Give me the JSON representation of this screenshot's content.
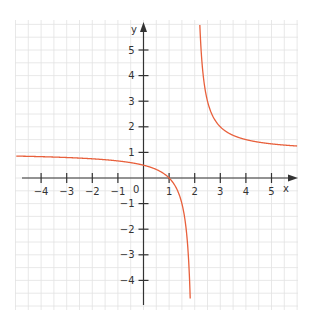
{
  "chart_data": {
    "type": "line",
    "title": "",
    "function": "y = (x - 1) / (x - 2)",
    "xlabel": "x",
    "ylabel": "y",
    "xlim": [
      -5,
      6
    ],
    "ylim": [
      -5,
      5.5
    ],
    "x_ticks": [
      -4,
      -3,
      -2,
      -1,
      1,
      2,
      3,
      4,
      5
    ],
    "y_ticks": [
      5,
      4,
      3,
      2,
      1,
      -1,
      -2,
      -3,
      -4
    ],
    "origin_label": "0",
    "grid": true,
    "grid_minor_step": 0.5,
    "vertical_asymptote": 2,
    "horizontal_asymptote": 1,
    "series": [
      {
        "name": "left branch",
        "x": [
          -5,
          -4,
          -3,
          -2,
          -1,
          0,
          1,
          1.5,
          1.8
        ],
        "y": [
          0.857,
          0.833,
          0.8,
          0.75,
          0.667,
          0.5,
          0,
          -1,
          -4
        ]
      },
      {
        "name": "right branch",
        "x": [
          2.2,
          2.5,
          3,
          4,
          5,
          6
        ],
        "y": [
          6,
          3,
          2,
          1.5,
          1.333,
          1.25
        ]
      }
    ],
    "colors": {
      "curve": "#e8603c",
      "axis": "#333333",
      "grid": "#e2e2e2"
    }
  },
  "labels": {
    "x_axis": "x",
    "y_axis": "y",
    "origin": "0",
    "x_ticks": [
      "−4",
      "−3",
      "−2",
      "−1",
      "1",
      "2",
      "3",
      "4",
      "5"
    ],
    "y_ticks": [
      "5",
      "4",
      "3",
      "2",
      "1",
      "−1",
      "−2",
      "−3",
      "−4"
    ]
  }
}
